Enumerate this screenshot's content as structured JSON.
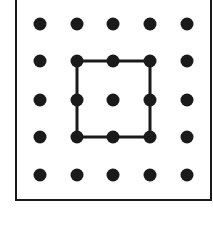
{
  "diagram": {
    "type": "dot-grid",
    "rows": 5,
    "cols": 5,
    "dot_color": "#1a1a1a",
    "line_color": "#1a1a1a",
    "grid_x": [
      40,
      77,
      113,
      150,
      187
    ],
    "grid_y": [
      24,
      61,
      100,
      137,
      175
    ],
    "square": {
      "corners": [
        [
          1,
          1
        ],
        [
          3,
          1
        ],
        [
          3,
          3
        ],
        [
          1,
          3
        ]
      ],
      "description": "square connecting grid points from column 2 to 4 and row 2 to 4"
    }
  }
}
